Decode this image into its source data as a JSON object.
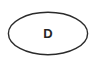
{
  "canvas": {
    "width": 96,
    "height": 67,
    "background_color": "#ffffff"
  },
  "diagram": {
    "type": "flowchart-node",
    "nodes": [
      {
        "id": "node-d",
        "shape": "ellipse",
        "label": "D",
        "stroke_color": "#2b2b2b",
        "fill_color": "#ffffff",
        "stroke_width": 1.4,
        "center_x": 48,
        "center_y": 33.5,
        "radius_x": 40,
        "radius_y": 21.5
      }
    ]
  }
}
